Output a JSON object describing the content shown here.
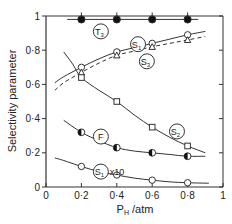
{
  "chart_data": {
    "type": "line",
    "title": "",
    "xlabel": "P_H / atm",
    "xlabel_main": "P",
    "xlabel_sub": "H",
    "xlabel_unit": " /atm",
    "ylabel": "Selectivity parameter",
    "xlim": [
      0,
      1
    ],
    "ylim": [
      0,
      1
    ],
    "grid": false,
    "legend_position": "inline labels (circled)",
    "x_ticks": [
      0,
      0.2,
      0.4,
      0.6,
      0.8,
      1
    ],
    "x_tick_labels": [
      "0",
      "0·2",
      "0·4",
      "0·6",
      "0·8",
      "1"
    ],
    "y_ticks": [
      0,
      0.2,
      0.4,
      0.6,
      0.8,
      1
    ],
    "y_tick_labels": [
      "0",
      "0·2",
      "0·4",
      "0·6",
      "0·8",
      "1"
    ],
    "x": [
      0.2,
      0.4,
      0.6,
      0.8
    ],
    "series": [
      {
        "name": "T3",
        "label_main": "T",
        "label_sub": "3",
        "marker": "filled-circle",
        "line": "solid",
        "values": [
          0.98,
          0.98,
          0.98,
          0.98
        ],
        "curve": [
          [
            0.12,
            0.98
          ],
          [
            0.86,
            0.98
          ]
        ],
        "label_pos": [
          0.31,
          0.91
        ]
      },
      {
        "name": "S1",
        "label_main": "S",
        "label_sub": "1",
        "marker": "open-circle",
        "line": "solid",
        "values": [
          0.7,
          0.79,
          0.84,
          0.89
        ],
        "curve": [
          [
            0.05,
            0.61
          ],
          [
            0.1,
            0.645
          ],
          [
            0.2,
            0.7
          ],
          [
            0.3,
            0.75
          ],
          [
            0.4,
            0.79
          ],
          [
            0.5,
            0.815
          ],
          [
            0.6,
            0.84
          ],
          [
            0.7,
            0.865
          ],
          [
            0.8,
            0.89
          ],
          [
            0.9,
            0.91
          ]
        ],
        "label_pos": [
          0.52,
          0.835
        ]
      },
      {
        "name": "S3",
        "label_main": "S",
        "label_sub": "3",
        "marker": "open-triangle",
        "line": "dashed",
        "values": [
          0.67,
          0.77,
          0.82,
          0.86
        ],
        "curve": [
          [
            0.05,
            0.565
          ],
          [
            0.1,
            0.61
          ],
          [
            0.2,
            0.67
          ],
          [
            0.3,
            0.725
          ],
          [
            0.4,
            0.77
          ],
          [
            0.5,
            0.795
          ],
          [
            0.6,
            0.82
          ],
          [
            0.7,
            0.84
          ],
          [
            0.8,
            0.86
          ],
          [
            0.9,
            0.88
          ]
        ],
        "label_pos": [
          0.57,
          0.735
        ]
      },
      {
        "name": "S2",
        "label_main": "S",
        "label_sub": "2",
        "marker": "open-square",
        "line": "solid",
        "values": [
          0.64,
          0.5,
          0.35,
          0.24
        ],
        "curve": [
          [
            0.1,
            0.79
          ],
          [
            0.15,
            0.72
          ],
          [
            0.2,
            0.64
          ],
          [
            0.3,
            0.565
          ],
          [
            0.4,
            0.5
          ],
          [
            0.5,
            0.42
          ],
          [
            0.6,
            0.35
          ],
          [
            0.7,
            0.29
          ],
          [
            0.8,
            0.24
          ],
          [
            0.9,
            0.2
          ]
        ],
        "label_pos": [
          0.74,
          0.325
        ]
      },
      {
        "name": "F",
        "label_main": "F",
        "label_sub": "",
        "marker": "half-filled-circle",
        "line": "solid",
        "values": [
          0.32,
          0.23,
          0.2,
          0.18
        ],
        "curve": [
          [
            0.1,
            0.39
          ],
          [
            0.2,
            0.32
          ],
          [
            0.3,
            0.27
          ],
          [
            0.4,
            0.23
          ],
          [
            0.5,
            0.21
          ],
          [
            0.6,
            0.2
          ],
          [
            0.7,
            0.19
          ],
          [
            0.8,
            0.18
          ],
          [
            0.9,
            0.18
          ]
        ],
        "label_pos": [
          0.31,
          0.295
        ]
      },
      {
        "name": "S1 x10",
        "label_main": "S",
        "label_sub": "1",
        "label_suffix": "x10",
        "marker": "open-circle",
        "line": "solid",
        "values": [
          0.12,
          0.07,
          0.04,
          0.025
        ],
        "curve": [
          [
            0.05,
            0.17
          ],
          [
            0.1,
            0.155
          ],
          [
            0.2,
            0.12
          ],
          [
            0.3,
            0.09
          ],
          [
            0.4,
            0.07
          ],
          [
            0.5,
            0.052
          ],
          [
            0.6,
            0.04
          ],
          [
            0.7,
            0.03
          ],
          [
            0.8,
            0.025
          ],
          [
            0.92,
            0.022
          ]
        ],
        "label_pos": [
          0.31,
          0.09
        ]
      }
    ]
  }
}
